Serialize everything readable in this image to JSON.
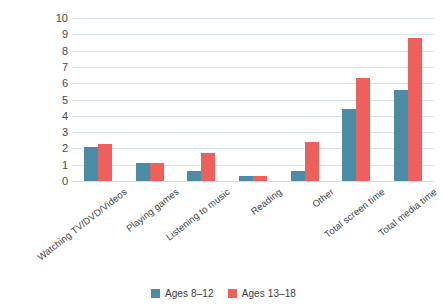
{
  "chart_data": {
    "type": "bar",
    "title": "",
    "subtitle": "",
    "xlabel": "",
    "ylabel": "",
    "ylim": [
      0,
      10
    ],
    "yticks": [
      0,
      1,
      2,
      3,
      4,
      5,
      6,
      7,
      8,
      9,
      10
    ],
    "grid": true,
    "legend_position": "bottom",
    "categories": [
      "Watching TV/DVD/Videos",
      "Playing games",
      "Listening to music",
      "Reading",
      "Other",
      "Total screen time",
      "Total media time"
    ],
    "series": [
      {
        "name": "Ages 8–12",
        "color": "#4a8ca3",
        "values": [
          2.1,
          1.1,
          0.6,
          0.3,
          0.6,
          4.4,
          5.6
        ]
      },
      {
        "name": "Ages 13–18",
        "color": "#ef5f5c",
        "values": [
          2.3,
          1.1,
          1.7,
          0.3,
          2.4,
          6.3,
          8.8
        ]
      }
    ]
  },
  "colors": {
    "series_a": "#4a8ca3",
    "series_b": "#ef5f5c",
    "gridline": "#d4e4ee",
    "background": "#ffffff",
    "text": "#3c3c3c"
  }
}
